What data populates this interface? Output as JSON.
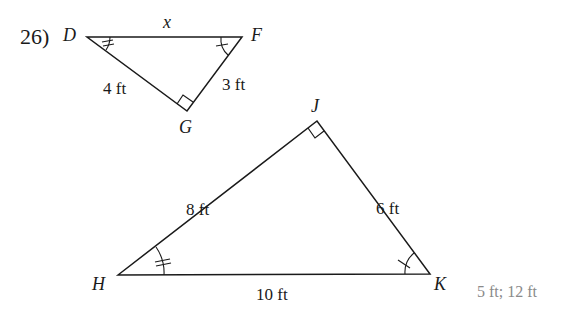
{
  "problem_number": "26)",
  "small_triangle": {
    "vertices": {
      "D": "D",
      "F": "F",
      "G": "G"
    },
    "sides": {
      "DF": "x",
      "DG": "4 ft",
      "FG": "3 ft"
    }
  },
  "large_triangle": {
    "vertices": {
      "J": "J",
      "H": "H",
      "K": "K"
    },
    "sides": {
      "HJ": "8 ft",
      "JK": "6 ft",
      "HK": "10 ft"
    }
  },
  "answer": "5 ft; 12 ft",
  "colors": {
    "line": "#1a1a1a",
    "answer": "#8a8a8a"
  }
}
